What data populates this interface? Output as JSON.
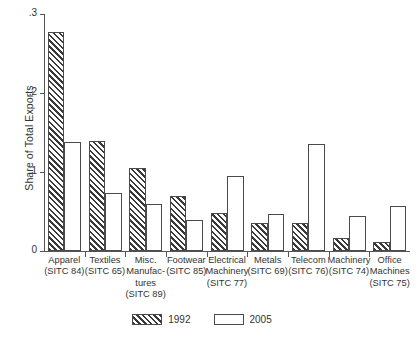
{
  "chart_data": {
    "type": "bar",
    "title": "",
    "subtitle": "",
    "xlabel": "",
    "ylabel": "Share of Total Exports",
    "ylim": [
      0,
      0.3
    ],
    "yticks": [
      0,
      0.1,
      0.2,
      0.3
    ],
    "ytick_labels": [
      "0",
      ".1",
      ".2",
      ".3"
    ],
    "grid": false,
    "legend_position": "bottom-center",
    "categories": [
      "Apparel (SITC 84)",
      "Textiles (SITC 65)",
      "Misc. Manufactures (SITC 89)",
      "Footwear (SITC 85)",
      "Electrical Machinery (SITC 77)",
      "Metals (SITC 69)",
      "Telecom (SITC 76)",
      "Machinery (SITC 74)",
      "Office Machines (SITC 75)"
    ],
    "category_lines": [
      [
        "Apparel",
        "(SITC 84)"
      ],
      [
        "Textiles",
        "(SITC 65)"
      ],
      [
        "Misc.",
        "Manufac-",
        "tures",
        "(SITC 89)"
      ],
      [
        "Footwear",
        "(SITC 85)"
      ],
      [
        "Electrical",
        "Machinery",
        "(SITC 77)"
      ],
      [
        "Metals",
        "(SITC 69)"
      ],
      [
        "Telecom",
        "(SITC 76)"
      ],
      [
        "Machinery",
        "(SITC 74)"
      ],
      [
        "Office",
        "Machines",
        "(SITC 75)"
      ]
    ],
    "series": [
      {
        "name": "1992",
        "fill": "hatched",
        "color": "#3a3a3a",
        "values": [
          0.277,
          0.139,
          0.105,
          0.07,
          0.048,
          0.035,
          0.035,
          0.016,
          0.011
        ]
      },
      {
        "name": "2005",
        "fill": "open",
        "color": "#ffffff",
        "values": [
          0.138,
          0.073,
          0.06,
          0.039,
          0.095,
          0.047,
          0.135,
          0.044,
          0.057
        ]
      }
    ]
  },
  "legend": {
    "items": [
      {
        "label": "1992",
        "swatch": "hatched-swatch"
      },
      {
        "label": "2005",
        "swatch": "open-swatch"
      }
    ]
  }
}
